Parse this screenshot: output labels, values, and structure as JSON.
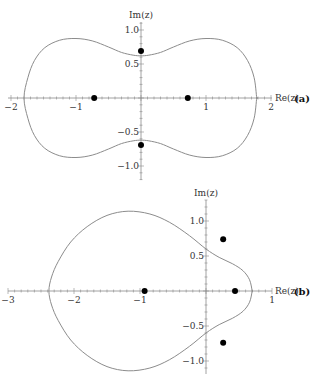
{
  "chart_data": [
    {
      "type": "line",
      "panel_label": "(a)",
      "xlabel": "Re(z)",
      "ylabel": "Im(z)",
      "xlim": [
        -2,
        2
      ],
      "ylim": [
        -1.1,
        1.2
      ],
      "x_ticks": [
        {
          "v": -2,
          "t": "−2"
        },
        {
          "v": -1,
          "t": "−1"
        },
        {
          "v": 1,
          "t": "1"
        },
        {
          "v": 2,
          "t": "2"
        }
      ],
      "y_ticks": [
        {
          "v": 1.0,
          "t": "1.0"
        },
        {
          "v": 0.5,
          "t": "0.5"
        },
        {
          "v": -0.5,
          "t": "−0.5"
        },
        {
          "v": -1.0,
          "t": "−1.0"
        }
      ],
      "grid": false,
      "curve_upper": [
        [
          1.78,
          0
        ],
        [
          1.74,
          0.3
        ],
        [
          1.64,
          0.55
        ],
        [
          1.48,
          0.74
        ],
        [
          1.25,
          0.85
        ],
        [
          1.0,
          0.875
        ],
        [
          0.75,
          0.84
        ],
        [
          0.5,
          0.75
        ],
        [
          0.3,
          0.67
        ],
        [
          0.12,
          0.63
        ],
        [
          0,
          0.62
        ],
        [
          -0.12,
          0.63
        ],
        [
          -0.3,
          0.67
        ],
        [
          -0.5,
          0.75
        ],
        [
          -0.75,
          0.84
        ],
        [
          -1.0,
          0.875
        ],
        [
          -1.25,
          0.85
        ],
        [
          -1.48,
          0.74
        ],
        [
          -1.64,
          0.55
        ],
        [
          -1.74,
          0.3
        ],
        [
          -1.8,
          0
        ]
      ],
      "points": [
        [
          -0.72,
          0
        ],
        [
          0.72,
          0
        ],
        [
          0,
          0.69
        ],
        [
          0,
          -0.69
        ]
      ],
      "origin_px": [
        141,
        98
      ],
      "scale_px": [
        65,
        68
      ],
      "axis_px": {
        "x0": 8,
        "x1": 272,
        "y0": 22,
        "y1": 180
      }
    },
    {
      "type": "line",
      "panel_label": "(b)",
      "xlabel": "Re(z)",
      "ylabel": "Im(z)",
      "xlim": [
        -3,
        1
      ],
      "ylim": [
        -1.2,
        1.2
      ],
      "x_ticks": [
        {
          "v": -3,
          "t": "−3"
        },
        {
          "v": -2,
          "t": "−2"
        },
        {
          "v": -1,
          "t": "−1"
        },
        {
          "v": 1,
          "t": "1"
        }
      ],
      "y_ticks": [
        {
          "v": 1.0,
          "t": "1.0"
        },
        {
          "v": 0.5,
          "t": "0.5"
        },
        {
          "v": -0.5,
          "t": "−0.5"
        },
        {
          "v": -1.0,
          "t": "−1.0"
        }
      ],
      "grid": false,
      "curve_upper": [
        [
          0.7,
          0
        ],
        [
          0.66,
          0.16
        ],
        [
          0.56,
          0.29
        ],
        [
          0.4,
          0.39
        ],
        [
          0.2,
          0.48
        ],
        [
          0,
          0.6
        ],
        [
          -0.25,
          0.79
        ],
        [
          -0.55,
          0.98
        ],
        [
          -0.85,
          1.1
        ],
        [
          -1.18,
          1.14
        ],
        [
          -1.5,
          1.08
        ],
        [
          -1.8,
          0.92
        ],
        [
          -2.05,
          0.7
        ],
        [
          -2.24,
          0.42
        ],
        [
          -2.34,
          0.2
        ],
        [
          -2.38,
          0
        ]
      ],
      "points": [
        [
          -0.93,
          0
        ],
        [
          0.44,
          0
        ],
        [
          0.26,
          0.74
        ],
        [
          0.26,
          -0.74
        ]
      ],
      "origin_px": [
        206,
        291
      ],
      "scale_px": [
        66,
        70
      ],
      "axis_px": {
        "x0": 8,
        "x1": 272,
        "y0": 200,
        "y1": 374
      }
    }
  ]
}
